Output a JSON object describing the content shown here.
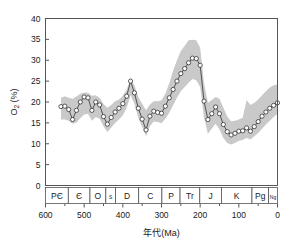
{
  "figure": {
    "background_color": "#ffffff",
    "frame_color": "#555555",
    "band_color": "#c9c9c9",
    "line_color": "#444444",
    "marker_fill": "#ffffff",
    "marker_stroke": "#333333"
  },
  "axes": {
    "y_title_main": "O",
    "y_title_sub": "2",
    "y_title_unit": " (%)",
    "y_title_full": "O2 (%)",
    "x_title": "年代(Ma)",
    "y_ticks": [
      "0",
      "5",
      "10",
      "15",
      "20",
      "25",
      "30",
      "35",
      "40"
    ],
    "x_ticks": [
      "600",
      "500",
      "400",
      "300",
      "200",
      "100",
      "0"
    ],
    "x_minor_ticks": [
      "550",
      "450",
      "350",
      "250",
      "150",
      "50"
    ]
  },
  "periods": [
    {
      "label": "PЄ",
      "start": 600,
      "end": 541
    },
    {
      "label": "Є",
      "start": 541,
      "end": 485
    },
    {
      "label": "O",
      "start": 485,
      "end": 444
    },
    {
      "label": "S",
      "start": 444,
      "end": 419
    },
    {
      "label": "D",
      "start": 419,
      "end": 359
    },
    {
      "label": "C",
      "start": 359,
      "end": 299
    },
    {
      "label": "P",
      "start": 299,
      "end": 252
    },
    {
      "label": "Tr",
      "start": 252,
      "end": 201
    },
    {
      "label": "J",
      "start": 201,
      "end": 145
    },
    {
      "label": "K",
      "start": 145,
      "end": 66
    },
    {
      "label": "Pg",
      "start": 66,
      "end": 23
    },
    {
      "label": "Ng",
      "start": 23,
      "end": 0
    }
  ],
  "chart_data": {
    "type": "line",
    "title": "",
    "xlabel": "年代(Ma)",
    "ylabel": "O2 (%)",
    "xlim": [
      600,
      0
    ],
    "ylim": [
      0,
      40
    ],
    "x_reversed": true,
    "grid": false,
    "legend": "none",
    "marker": "open-circle",
    "uncertainty_band": true,
    "x": [
      560,
      550,
      540,
      530,
      520,
      510,
      500,
      490,
      480,
      470,
      460,
      450,
      440,
      430,
      420,
      410,
      400,
      390,
      380,
      370,
      360,
      350,
      340,
      330,
      320,
      310,
      300,
      290,
      280,
      270,
      260,
      250,
      240,
      230,
      220,
      210,
      200,
      190,
      180,
      170,
      160,
      150,
      140,
      130,
      120,
      110,
      100,
      90,
      80,
      70,
      60,
      50,
      40,
      30,
      20,
      10,
      0
    ],
    "series": [
      {
        "name": "O2 mean",
        "values": [
          18.9,
          19.0,
          18.2,
          15.8,
          18.0,
          20.0,
          21.2,
          21.0,
          18.0,
          20.0,
          19.3,
          16.5,
          14.7,
          16.3,
          17.6,
          18.5,
          19.6,
          21.4,
          25.0,
          22.2,
          18.5,
          15.9,
          13.3,
          16.6,
          17.8,
          17.5,
          17.3,
          19.0,
          21.0,
          23.0,
          25.0,
          26.8,
          28.0,
          29.4,
          30.5,
          30.4,
          28.8,
          20.2,
          15.8,
          17.2,
          18.8,
          17.2,
          14.6,
          12.9,
          12.1,
          12.5,
          13.0,
          13.1,
          13.8,
          13.0,
          14.1,
          15.3,
          16.6,
          17.6,
          18.5,
          19.2,
          19.8
        ]
      },
      {
        "name": "O2 upper bound",
        "values": [
          21.0,
          21.4,
          21.0,
          20.8,
          21.3,
          22.0,
          22.3,
          22.2,
          21.5,
          21.6,
          21.0,
          19.5,
          18.6,
          19.3,
          20.2,
          20.6,
          21.5,
          23.0,
          25.5,
          24.0,
          21.2,
          19.6,
          18.0,
          19.4,
          20.2,
          20.2,
          20.4,
          22.0,
          24.5,
          27.5,
          30.0,
          32.2,
          33.5,
          34.8,
          34.9,
          34.8,
          33.0,
          24.5,
          19.8,
          20.5,
          21.2,
          20.8,
          18.6,
          16.5,
          15.4,
          15.5,
          15.8,
          16.2,
          20.5,
          19.3,
          19.8,
          20.6,
          21.6,
          22.6,
          23.5,
          24.0,
          24.2
        ]
      },
      {
        "name": "O2 lower bound",
        "values": [
          15.8,
          15.8,
          15.5,
          14.8,
          15.1,
          16.1,
          17.0,
          17.2,
          15.5,
          16.4,
          16.0,
          14.2,
          12.8,
          13.9,
          15.0,
          15.8,
          16.8,
          18.6,
          21.6,
          19.6,
          16.2,
          14.0,
          11.8,
          14.2,
          15.3,
          15.2,
          14.9,
          16.0,
          17.4,
          19.2,
          21.0,
          22.6,
          23.6,
          24.6,
          25.5,
          25.2,
          23.6,
          16.2,
          12.4,
          13.6,
          14.8,
          13.4,
          11.4,
          10.2,
          9.8,
          10.2,
          10.7,
          10.9,
          11.4,
          11.0,
          11.8,
          12.6,
          13.6,
          14.6,
          15.5,
          16.4,
          17.2
        ]
      }
    ]
  }
}
